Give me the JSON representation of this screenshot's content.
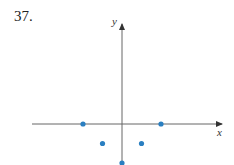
{
  "problem_number": "37.",
  "chart_data": {
    "type": "scatter",
    "title": "",
    "xlabel": "x",
    "ylabel": "y",
    "grid": false,
    "x": [
      -2,
      -1,
      0,
      1,
      2
    ],
    "y": [
      0,
      -1,
      -2,
      -1,
      0
    ],
    "points": [
      {
        "x": -2,
        "y": 0
      },
      {
        "x": -1,
        "y": -1
      },
      {
        "x": 0,
        "y": -2
      },
      {
        "x": 1,
        "y": -1
      },
      {
        "x": 2,
        "y": 0
      }
    ],
    "point_color": "#2a7fc1",
    "axis_color": "#555555"
  }
}
